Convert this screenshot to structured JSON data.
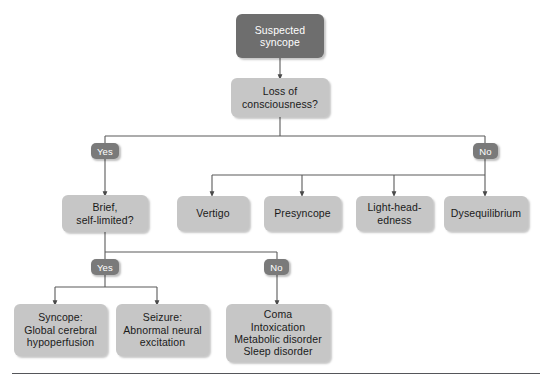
{
  "diagram": {
    "title_node": "Suspected syncope",
    "background_color": "#ffffff",
    "node_fill": "#c6c6c6",
    "root_fill": "#6e6e6e",
    "label_fill": "#7a7a7a",
    "text_color": "#1a1a1a",
    "root_text_color": "#ffffff",
    "edge_color": "#5a5a5a",
    "rule_color": "#55565a"
  },
  "nodes": {
    "root": {
      "label": "Suspected\nsyncope"
    },
    "decision_loc": {
      "label": "Loss of\nconsciousness?"
    },
    "decision_brief": {
      "label": "Brief,\nself-limited?"
    },
    "vertigo": {
      "label": "Vertigo"
    },
    "presyncope": {
      "label": "Presyncope"
    },
    "lightheadedness": {
      "label": "Light-head-\nedness"
    },
    "dysequilibrium": {
      "label": "Dysequilibrium"
    },
    "syncope_outcome": {
      "label": "Syncope:\nGlobal cerebral\nhypoperfusion"
    },
    "seizure_outcome": {
      "label": "Seizure:\nAbnormal neural\nexcitation"
    },
    "other_outcome": {
      "label": "Coma\nIntoxication\nMetabolic disorder\nSleep disorder"
    }
  },
  "edge_labels": {
    "loc_yes": "Yes",
    "loc_no": "No",
    "brief_yes": "Yes",
    "brief_no": "No"
  }
}
